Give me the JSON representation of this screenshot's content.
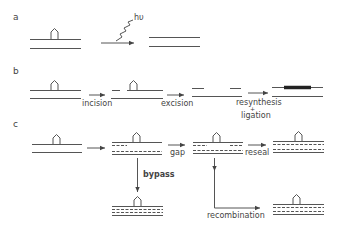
{
  "panels": {
    "a": {
      "label": "a",
      "photon_label": "hυ"
    },
    "b": {
      "label": "b",
      "steps": [
        "incision",
        "excision",
        "resynthesis",
        "+",
        "ligation"
      ]
    },
    "c": {
      "label": "c",
      "steps": [
        "gap",
        "reseal",
        "bypass",
        "recombination"
      ]
    }
  },
  "colors": {
    "line": "#555555",
    "text": "#444444",
    "new_dna": "#222222"
  }
}
